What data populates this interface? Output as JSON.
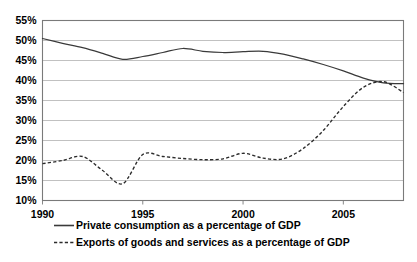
{
  "chart_data": {
    "type": "line",
    "title": "",
    "xlabel": "",
    "ylabel": "",
    "xlim": [
      1990,
      2008
    ],
    "ylim": [
      10,
      55
    ],
    "grid": true,
    "legend_position": "bottom",
    "x_tick_labels": [
      "1990",
      "1995",
      "2000",
      "2005"
    ],
    "x_ticks": [
      1990,
      1995,
      2000,
      2005
    ],
    "y_tick_labels": [
      "10%",
      "15%",
      "20%",
      "25%",
      "30%",
      "35%",
      "40%",
      "45%",
      "50%",
      "55%"
    ],
    "y_ticks": [
      10,
      15,
      20,
      25,
      30,
      35,
      40,
      45,
      50,
      55
    ],
    "x": [
      1990,
      1991,
      1992,
      1993,
      1994,
      1995,
      1996,
      1997,
      1998,
      1999,
      2000,
      2001,
      2002,
      2003,
      2004,
      2005,
      2006,
      2007,
      2008
    ],
    "series": [
      {
        "name": "Private consumption as a percentage of GDP",
        "style": "solid",
        "values": [
          50.5,
          49.3,
          48.2,
          46.8,
          45.3,
          46.0,
          47.0,
          48.0,
          47.3,
          47.0,
          47.2,
          47.3,
          46.6,
          45.4,
          44.0,
          42.4,
          40.6,
          39.4,
          39.2
        ]
      },
      {
        "name": "Exports of goods and services as a percentage of GDP",
        "style": "dashed",
        "values": [
          19.2,
          20.0,
          21.0,
          17.5,
          14.2,
          21.5,
          21.0,
          20.5,
          20.2,
          20.4,
          21.8,
          20.6,
          20.4,
          23.0,
          27.5,
          33.5,
          38.3,
          39.7,
          37.0
        ]
      }
    ]
  },
  "legend": {
    "items": [
      {
        "label": "Private consumption as a percentage of GDP",
        "style": "solid"
      },
      {
        "label": "Exports of goods and services as a percentage of GDP",
        "style": "dashed"
      }
    ]
  }
}
